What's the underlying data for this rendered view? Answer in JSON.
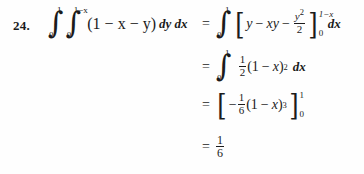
{
  "page": {
    "background_color": "#fefefe",
    "text_color": "#1b1b1b",
    "problem_number": "24."
  },
  "math": {
    "line1": {
      "outer_integral_lower": "0",
      "outer_integral_upper": "1",
      "inner_integral_lower": "0",
      "inner_integral_upper": "1−x",
      "integrand": "(1 − x − y)",
      "differentials": "dy dx",
      "equals": "=",
      "rhs_integral_lower": "0",
      "rhs_integral_upper": "1",
      "bracket_open": "[",
      "bracket_body": "y − xy − y²/2",
      "bracket_close": "]",
      "bracket_upper_limit": "1−x",
      "bracket_lower_limit": "0",
      "trailing_differential": "dx",
      "term_y": "y",
      "minus": "−",
      "term_xy": "xy",
      "frac_num": "y",
      "frac_num_exp": "2",
      "frac_den": "2"
    },
    "line2": {
      "equals": "=",
      "integral_lower": "0",
      "integral_upper": "1",
      "frac_num": "1",
      "frac_den": "2",
      "body": "(1 − x)",
      "exponent": "2",
      "differential": "dx",
      "open_paren": "(",
      "one": "1",
      "minus": "−",
      "x": "x",
      "close_paren": ")"
    },
    "line3": {
      "equals": "=",
      "bracket_open": "[",
      "sign": "−",
      "frac_num": "1",
      "frac_den": "6",
      "body": "(1 − x)",
      "exponent": "3",
      "bracket_close": "]",
      "bracket_upper_limit": "1",
      "bracket_lower_limit": "0",
      "open_paren": "(",
      "one": "1",
      "minus": "−",
      "x": "x",
      "close_paren": ")"
    },
    "line4": {
      "equals": "=",
      "result_num": "1",
      "result_den": "6"
    },
    "symbols": {
      "integral": "∫",
      "bracket_left": "[",
      "bracket_right": "]"
    }
  }
}
